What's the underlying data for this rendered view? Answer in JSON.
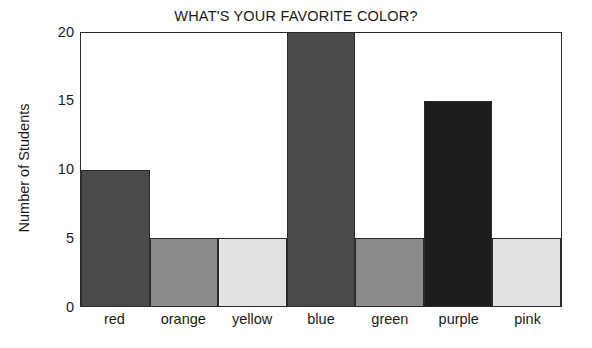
{
  "chart_data": {
    "type": "bar",
    "title": "WHAT'S YOUR FAVORITE COLOR?",
    "xlabel": "",
    "ylabel": "Number of Students",
    "categories": [
      "red",
      "orange",
      "yellow",
      "blue",
      "green",
      "purple",
      "pink"
    ],
    "values": [
      10,
      5,
      5,
      20,
      5,
      15,
      5
    ],
    "bar_colors": [
      "#4a4a4a",
      "#8a8a8a",
      "#e2e2e2",
      "#4a4a4a",
      "#8a8a8a",
      "#1c1c1c",
      "#e2e2e2"
    ],
    "ylim": [
      0,
      20
    ],
    "yticks": [
      0,
      5,
      10,
      15,
      20
    ],
    "ytick_labels": [
      "0",
      "5",
      "10",
      "15",
      "20"
    ],
    "grid": false,
    "legend": null
  },
  "axis": {
    "y_tick_0": "0",
    "y_tick_5": "5",
    "y_tick_10": "10",
    "y_tick_15": "15",
    "y_tick_20": "20"
  },
  "x_labels": {
    "c0": "red",
    "c1": "orange",
    "c2": "yellow",
    "c3": "blue",
    "c4": "green",
    "c5": "purple",
    "c6": "pink"
  }
}
